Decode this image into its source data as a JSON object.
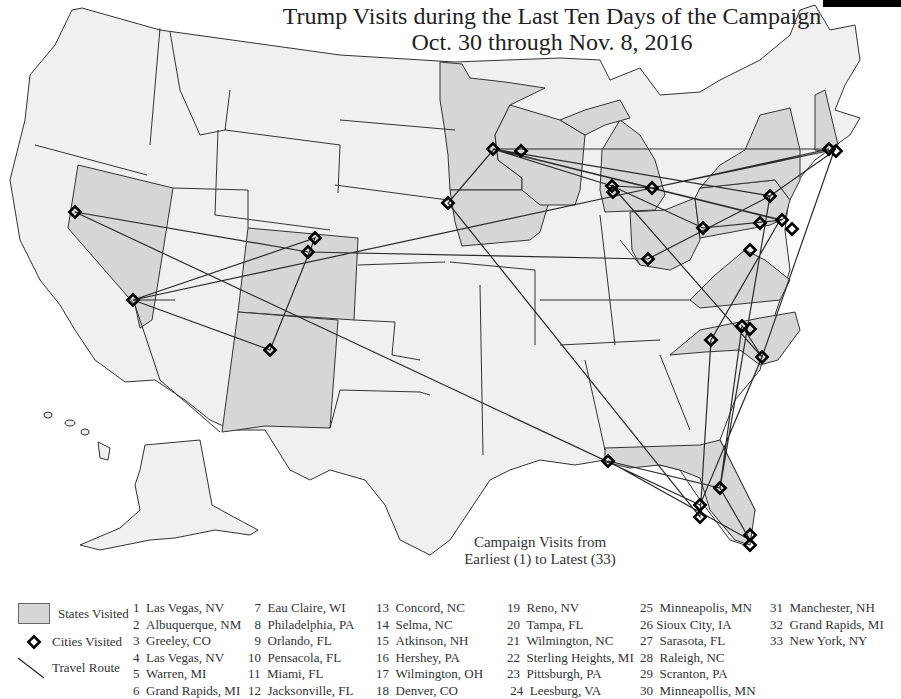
{
  "title": {
    "line1": "Trump Visits during the Last Ten Days of the Campaign",
    "line2": "Oct. 30 through Nov. 8, 2016"
  },
  "subtitle": {
    "line1": "Campaign Visits from",
    "line2": "Earliest (1) to Latest (33)"
  },
  "colors": {
    "visited_state": "#d6d6d6",
    "other_state": "#f0f0f0",
    "border": "#333333",
    "route": "#2a2a2a",
    "city_marker": "#000000"
  },
  "legend": {
    "states_visited": "States Visited",
    "cities_visited": "Cities Visited",
    "travel_route": "Travel Route",
    "icons": [
      "gray-swatch",
      "diamond-marker",
      "diagonal-line"
    ]
  },
  "visits": [
    {
      "n": "1",
      "city": "Las Vegas, NV"
    },
    {
      "n": "2",
      "city": "Albuquerque, NM"
    },
    {
      "n": "3",
      "city": "Greeley, CO"
    },
    {
      "n": "4",
      "city": "Las Vegas, NV"
    },
    {
      "n": "5",
      "city": "Warren, MI"
    },
    {
      "n": "6",
      "city": "Grand Rapids, MI"
    },
    {
      "n": "7",
      "city": "Eau Claire, WI"
    },
    {
      "n": "8",
      "city": "Philadelphia, PA"
    },
    {
      "n": "9",
      "city": "Orlando, FL"
    },
    {
      "n": "10",
      "city": "Pensacola, FL"
    },
    {
      "n": "11",
      "city": "Miami, FL"
    },
    {
      "n": "12",
      "city": "Jacksonville, FL"
    },
    {
      "n": "13",
      "city": "Concord, NC"
    },
    {
      "n": "14",
      "city": "Selma, NC"
    },
    {
      "n": "15",
      "city": "Atkinson, NH"
    },
    {
      "n": "16",
      "city": "Hershey, PA"
    },
    {
      "n": "17",
      "city": "Wilmington, OH"
    },
    {
      "n": "18",
      "city": "Denver, CO"
    },
    {
      "n": "19",
      "city": "Reno, NV"
    },
    {
      "n": "20",
      "city": "Tampa, FL"
    },
    {
      "n": "21",
      "city": "Wilmington, NC"
    },
    {
      "n": "22",
      "city": "Sterling Heights, MI"
    },
    {
      "n": "23",
      "city": "Pittsburgh, PA"
    },
    {
      "n": "24",
      "city": "Leesburg, VA"
    },
    {
      "n": "25",
      "city": "Minneapolis, MN"
    },
    {
      "n": "26",
      "city": "Sioux City, IA"
    },
    {
      "n": "27",
      "city": "Sarasota, FL"
    },
    {
      "n": "28",
      "city": "Raleigh, NC"
    },
    {
      "n": "29",
      "city": "Scranton, PA"
    },
    {
      "n": "30",
      "city": "Minneapollis, MN"
    },
    {
      "n": "31",
      "city": "Manchester, NH"
    },
    {
      "n": "32",
      "city": "Grand Rapids, MI"
    },
    {
      "n": "33",
      "city": "New York, NY"
    }
  ],
  "states_visited": [
    "NV",
    "NM",
    "CO",
    "MI",
    "WI",
    "PA",
    "FL",
    "NC",
    "NH",
    "OH",
    "MN",
    "IA",
    "VA",
    "NY"
  ]
}
